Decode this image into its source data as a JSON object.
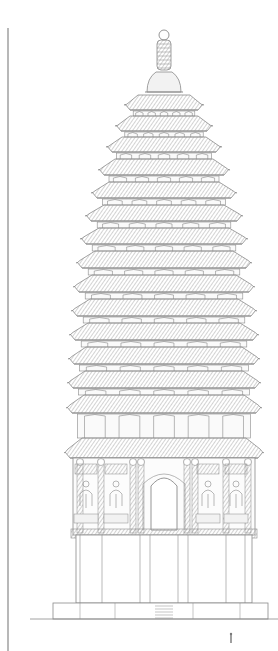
{
  "drawing": {
    "subject": "pagoda-elevation",
    "style": "architectural line drawing",
    "colors": {
      "ink": "#8a8a8a",
      "hatch": "#b0b0b0",
      "paper": "#ffffff",
      "window_fill": "#e6e6e6"
    },
    "margin_line": {
      "x": 8,
      "y1": 28,
      "y2": 651
    },
    "center_x": 164,
    "finial": {
      "ball": {
        "cy": 35,
        "r": 5
      },
      "spire": {
        "top": 40,
        "bottom": 70,
        "width": 14
      },
      "lotus_base": {
        "top": 72,
        "bottom": 92,
        "width": 34
      }
    },
    "tiers": [
      {
        "roof_top": 95,
        "roof_bottom": 110,
        "half_top": 26,
        "half_bottom": 38
      },
      {
        "roof_top": 116,
        "roof_bottom": 131,
        "half_top": 34,
        "half_bottom": 47
      },
      {
        "roof_top": 137,
        "roof_bottom": 152,
        "half_top": 42,
        "half_bottom": 56
      },
      {
        "roof_top": 159,
        "roof_bottom": 175,
        "half_top": 49,
        "half_bottom": 64
      },
      {
        "roof_top": 182,
        "roof_bottom": 198,
        "half_top": 55,
        "half_bottom": 71
      },
      {
        "roof_top": 205,
        "roof_bottom": 221,
        "half_top": 60,
        "half_bottom": 77
      },
      {
        "roof_top": 228,
        "roof_bottom": 244,
        "half_top": 65,
        "half_bottom": 82
      },
      {
        "roof_top": 251,
        "roof_bottom": 268,
        "half_top": 69,
        "half_bottom": 86
      },
      {
        "roof_top": 275,
        "roof_bottom": 292,
        "half_top": 72,
        "half_bottom": 89
      },
      {
        "roof_top": 299,
        "roof_bottom": 316,
        "half_top": 74,
        "half_bottom": 91
      },
      {
        "roof_top": 323,
        "roof_bottom": 340,
        "half_top": 76,
        "half_bottom": 93
      },
      {
        "roof_top": 347,
        "roof_bottom": 364,
        "half_top": 78,
        "half_bottom": 94
      },
      {
        "roof_top": 371,
        "roof_bottom": 388,
        "half_top": 79,
        "half_bottom": 95
      },
      {
        "roof_top": 395,
        "roof_bottom": 413,
        "half_top": 80,
        "half_bottom": 96
      },
      {
        "roof_top": 438,
        "roof_bottom": 458,
        "half_top": 82,
        "half_bottom": 98
      }
    ],
    "main_body": {
      "top": 458,
      "bottom": 535,
      "left": 73,
      "right": 255,
      "arch_door": {
        "cx": 164,
        "top": 470,
        "bottom": 530,
        "half_width": 13
      },
      "pilasters_x": [
        80,
        101,
        133,
        141,
        187,
        195,
        226,
        248
      ],
      "niches": [
        {
          "cx": 86
        },
        {
          "cx": 116
        },
        {
          "cx": 208
        },
        {
          "cx": 236
        }
      ]
    },
    "plinth": {
      "top": 535,
      "bottom": 603,
      "left": 76,
      "right": 252,
      "column_x": [
        80,
        102,
        140,
        150,
        178,
        188,
        226,
        245
      ]
    },
    "base_platform": {
      "top": 603,
      "bottom": 619,
      "left": 53,
      "right": 268,
      "steps": {
        "x": 155,
        "width": 18
      }
    },
    "ground_line": {
      "y": 619,
      "x1": 30,
      "x2": 278
    },
    "scale_figure": {
      "x": 231,
      "y": 634,
      "height": 9
    }
  }
}
